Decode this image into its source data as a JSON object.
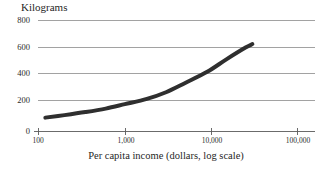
{
  "chart_data": {
    "type": "line",
    "title": "",
    "ylabel": "Kilograms",
    "xlabel": "Per capita income (dollars, log scale)",
    "x_scale": "log",
    "xlim": [
      100,
      100000
    ],
    "ylim": [
      0,
      800
    ],
    "grid": true,
    "legend": null,
    "y_ticks": [
      800,
      600,
      400,
      200,
      0
    ],
    "y_tick_labels": [
      "800",
      "600",
      "400",
      "200",
      "0"
    ],
    "x_ticks": [
      100,
      1000,
      10000,
      100000
    ],
    "x_tick_labels": [
      "100",
      "1,000",
      "10,000",
      "100,000"
    ],
    "series": [
      {
        "name": "Kilograms per capita",
        "color": "#2f2f2f",
        "line_width": 4,
        "x": [
          120,
          200,
          350,
          600,
          1000,
          1800,
          3000,
          5000,
          9000,
          15000,
          25000,
          30000
        ],
        "y": [
          100,
          118,
          140,
          165,
          197,
          235,
          283,
          350,
          430,
          520,
          605,
          630
        ]
      }
    ]
  },
  "axis": {
    "y_axis_title": "Kilograms",
    "x_axis_title": "Per capita income (dollars, log scale)",
    "y_labels": [
      "800",
      "600",
      "400",
      "200",
      "0"
    ],
    "x_labels": [
      "100",
      "1,000",
      "10,000",
      "100,000"
    ]
  },
  "style": {
    "grid_color": "#808080",
    "line_color": "#2f2f2f",
    "text_color": "#1f1f1f",
    "background": "#ffffff"
  }
}
